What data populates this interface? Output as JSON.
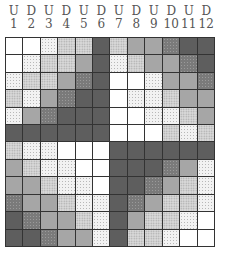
{
  "headers": [
    {
      "dir": "U",
      "num": "1"
    },
    {
      "dir": "D",
      "num": "2"
    },
    {
      "dir": "U",
      "num": "3"
    },
    {
      "dir": "D",
      "num": "4"
    },
    {
      "dir": "U",
      "num": "5"
    },
    {
      "dir": "D",
      "num": "6"
    },
    {
      "dir": "U",
      "num": "7"
    },
    {
      "dir": "D",
      "num": "8"
    },
    {
      "dir": "U",
      "num": "9"
    },
    {
      "dir": "D",
      "num": "10"
    },
    {
      "dir": "U",
      "num": "11"
    },
    {
      "dir": "D",
      "num": "12"
    }
  ],
  "legend_shades": {
    "W": "white",
    "L": "light speckled",
    "M": "medium speckled",
    "G": "medium gray",
    "S": "dark speckled",
    "D": "dark gray"
  },
  "grid": [
    [
      "W",
      "W",
      "L",
      "M",
      "M",
      "D",
      "M",
      "G",
      "G",
      "S",
      "D",
      "D"
    ],
    [
      "W",
      "L",
      "M",
      "M",
      "G",
      "D",
      "L",
      "M",
      "G",
      "G",
      "S",
      "D"
    ],
    [
      "L",
      "M",
      "M",
      "G",
      "S",
      "D",
      "W",
      "W",
      "L",
      "G",
      "G",
      "S"
    ],
    [
      "M",
      "L",
      "G",
      "S",
      "D",
      "D",
      "W",
      "L",
      "L",
      "M",
      "G",
      "G"
    ],
    [
      "L",
      "G",
      "S",
      "D",
      "D",
      "D",
      "W",
      "W",
      "L",
      "L",
      "M",
      "G"
    ],
    [
      "D",
      "D",
      "D",
      "D",
      "D",
      "D",
      "W",
      "W",
      "W",
      "M",
      "L",
      "M"
    ],
    [
      "M",
      "L",
      "L",
      "W",
      "W",
      "W",
      "D",
      "D",
      "D",
      "D",
      "D",
      "D"
    ],
    [
      "G",
      "M",
      "L",
      "L",
      "W",
      "W",
      "D",
      "D",
      "D",
      "S",
      "G",
      "L"
    ],
    [
      "G",
      "G",
      "M",
      "L",
      "L",
      "W",
      "D",
      "D",
      "S",
      "G",
      "M",
      "L"
    ],
    [
      "S",
      "G",
      "G",
      "M",
      "L",
      "L",
      "D",
      "S",
      "G",
      "M",
      "M",
      "L"
    ],
    [
      "D",
      "S",
      "G",
      "G",
      "M",
      "L",
      "D",
      "G",
      "M",
      "M",
      "L",
      "W"
    ],
    [
      "D",
      "D",
      "S",
      "G",
      "G",
      "L",
      "D",
      "M",
      "M",
      "L",
      "W",
      "W"
    ]
  ]
}
